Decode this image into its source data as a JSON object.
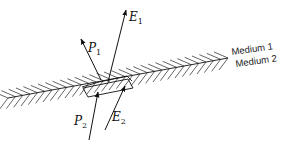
{
  "figure": {
    "type": "boundary-condition-pillbox",
    "interface": {
      "from": [
        8,
        98
      ],
      "to": [
        228,
        58
      ],
      "label_above": "Medium 1",
      "label_below": "Medium 2"
    },
    "vectors": [
      {
        "name": "E1",
        "symbol": "E",
        "subscript": "1",
        "tail": [
          107,
          82
        ],
        "head": [
          126,
          10
        ]
      },
      {
        "name": "P1",
        "symbol": "P",
        "subscript": "1",
        "tail": [
          101,
          80
        ],
        "head": [
          81,
          39
        ]
      },
      {
        "name": "P2",
        "symbol": "P",
        "subscript": "2",
        "tail": [
          89,
          140
        ],
        "head": [
          98,
          91
        ]
      },
      {
        "name": "E2",
        "symbol": "E",
        "subscript": "2",
        "tail": [
          105,
          130
        ],
        "head": [
          125,
          85
        ]
      }
    ],
    "labels": {
      "E1": {
        "main": "E",
        "sub": "1"
      },
      "P1": {
        "main": "P",
        "sub": "1"
      },
      "P2": {
        "main": "P",
        "sub": "2"
      },
      "E2": {
        "main": "E",
        "sub": "2"
      },
      "medium1": "Medium 1",
      "medium2": "Medium 2"
    },
    "colors": {
      "ink": "#111111",
      "background": "#ffffff"
    }
  }
}
